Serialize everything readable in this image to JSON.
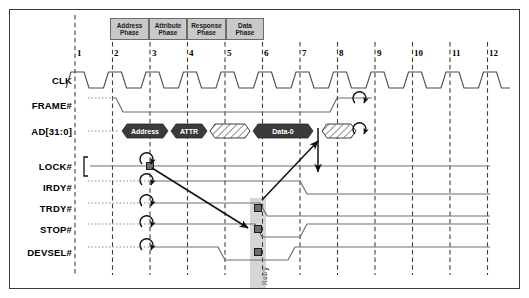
{
  "diagram": {
    "geometry": {
      "grid_x0": 75,
      "grid_step": 37.5,
      "cycle_count": 12
    },
    "phases": [
      {
        "name": "address-phase",
        "line1": "Address",
        "line2": "Phase",
        "x": 110,
        "w": 39
      },
      {
        "name": "attribute-phase",
        "line1": "Attribute",
        "line2": "Phase",
        "x": 149,
        "w": 38
      },
      {
        "name": "response-phase",
        "line1": "Response",
        "line2": "Phase",
        "x": 187,
        "w": 39
      },
      {
        "name": "data-phase",
        "line1": "Data",
        "line2": "Phase",
        "x": 226,
        "w": 38
      }
    ],
    "cycle_numbers": [
      "1",
      "2",
      "3",
      "4",
      "5",
      "6",
      "7",
      "8",
      "9",
      "10",
      "11",
      "12"
    ],
    "signals": [
      {
        "name": "clk",
        "label": "CLK",
        "y": 80
      },
      {
        "name": "frame",
        "label": "FRAME#",
        "y": 105
      },
      {
        "name": "ad",
        "label": "AD[31:0]",
        "y": 131
      },
      {
        "name": "lock",
        "label": "LOCK#",
        "y": 166
      },
      {
        "name": "irdy",
        "label": "IRDY#",
        "y": 187
      },
      {
        "name": "trdy",
        "label": "TRDY#",
        "y": 208
      },
      {
        "name": "stop",
        "label": "STOP#",
        "y": 229
      },
      {
        "name": "devsel",
        "label": "DEVSEL#",
        "y": 252
      }
    ],
    "bus_segments": [
      {
        "name": "bus-address",
        "label": "Address",
        "x": 122,
        "w": 46,
        "type": "data"
      },
      {
        "name": "bus-attr",
        "label": "ATTR",
        "x": 171,
        "w": 36,
        "type": "data"
      },
      {
        "name": "bus-turnaround",
        "label": "",
        "x": 210,
        "w": 40,
        "type": "hatched"
      },
      {
        "name": "bus-data0",
        "label": "Data-0",
        "x": 253,
        "w": 60,
        "type": "data"
      },
      {
        "name": "bus-turnaround-2",
        "label": "",
        "x": 322,
        "w": 34,
        "type": "hatched"
      }
    ],
    "annotations": {
      "retry_label": "Retry",
      "retry_band_x": 250,
      "retry_band_w": 16,
      "lock_bracket_x": 84,
      "markers": [
        {
          "name": "marker-lock",
          "x": 150,
          "y": 166
        },
        {
          "name": "marker-trdy-retry",
          "x": 258,
          "y": 208
        },
        {
          "name": "marker-stop-retry",
          "x": 258,
          "y": 229
        },
        {
          "name": "marker-devsel-retry",
          "x": 258,
          "y": 252
        }
      ],
      "turnaround_left_x": 150,
      "turnaround_left_ys": [
        187,
        208,
        229,
        252
      ],
      "turnaround_right_x": 362,
      "turnaround_right_ys": [
        105,
        131
      ]
    },
    "colors": {
      "phase_box_fill": "#c9c9c9",
      "bus_fill": "#3a3a3a",
      "signal_stroke": "#6e6e6e",
      "grid_stroke": "#3f3f3f",
      "band_fill": "#bdbdbd",
      "frame_border": "#3a3a3a"
    }
  }
}
